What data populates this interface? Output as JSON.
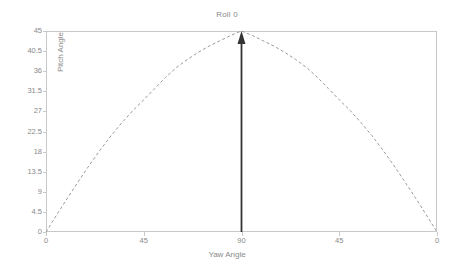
{
  "chart_data": {
    "type": "line",
    "title": "Roll 0",
    "xlabel": "Yaw Angle",
    "ylabel": "Pitch Angle",
    "xlim": [
      0,
      180
    ],
    "ylim": [
      0,
      45
    ],
    "grid": false,
    "legend": "none",
    "line_style": "dashed",
    "line_color": "#9a9a9a",
    "xtick_positions": [
      0,
      45,
      90,
      135,
      180
    ],
    "xtick_labels": [
      "0",
      "45",
      "90",
      "45",
      "0"
    ],
    "ytick_values": [
      0,
      4.5,
      9,
      13.5,
      18,
      22.5,
      27,
      31.5,
      36,
      40.5,
      45
    ],
    "ytick_labels": [
      "0",
      "4.5",
      "9",
      "13.5",
      "18",
      "22.5",
      "27",
      "31.5",
      "36",
      "40.5",
      "45"
    ],
    "x": [
      0,
      5,
      10,
      15,
      20,
      25,
      30,
      35,
      40,
      45,
      50,
      55,
      60,
      65,
      70,
      75,
      80,
      85,
      90,
      95,
      100,
      105,
      110,
      115,
      120,
      125,
      130,
      135,
      140,
      145,
      150,
      155,
      160,
      165,
      170,
      175,
      180
    ],
    "values": [
      0.0,
      3.9,
      7.7,
      11.4,
      15.0,
      18.4,
      21.6,
      24.5,
      27.2,
      29.6,
      32.1,
      34.6,
      36.8,
      38.6,
      40.2,
      41.6,
      42.8,
      44.0,
      45.0,
      44.0,
      42.8,
      41.6,
      40.2,
      38.6,
      36.8,
      34.6,
      32.1,
      29.6,
      27.2,
      24.5,
      21.6,
      18.4,
      15.0,
      11.4,
      7.7,
      3.9,
      0.0
    ],
    "annotations": [
      {
        "name": "peak-arrow",
        "type": "arrow",
        "x": 90,
        "y_from": 0,
        "y_to": 45,
        "direction": "up",
        "color": "#333333"
      }
    ]
  },
  "colors": {
    "frame": "#c8c8c8",
    "text": "#8a8a8a",
    "curve": "#9a9a9a",
    "arrow": "#333333",
    "background": "#ffffff"
  }
}
